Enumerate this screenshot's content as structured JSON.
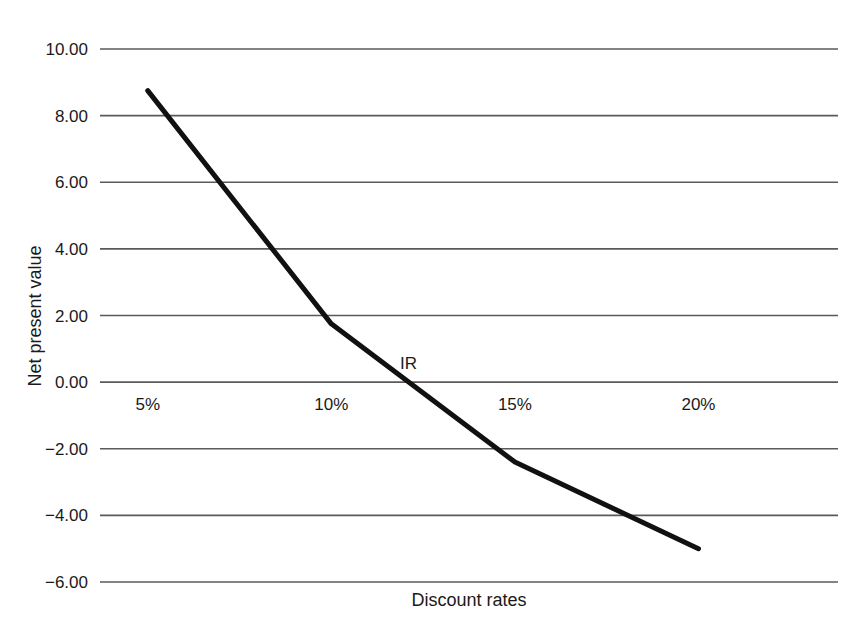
{
  "chart_data": {
    "type": "line",
    "title": "",
    "xlabel": "Discount rates",
    "ylabel": "Net present value",
    "x": [
      5,
      10,
      15,
      20
    ],
    "x_tick_labels": [
      "5%",
      "10%",
      "15%",
      "20%"
    ],
    "y_tick_labels": [
      "10.00",
      "8.00",
      "6.00",
      "4.00",
      "2.00",
      "0.00",
      "−2.00",
      "−4.00",
      "−6.00"
    ],
    "y_tick_values": [
      10,
      8,
      6,
      4,
      2,
      0,
      -2,
      -4,
      -6
    ],
    "series": [
      {
        "name": "Net present value",
        "values": [
          8.75,
          1.75,
          -2.4,
          -5.0
        ],
        "color": "#111111",
        "line_width": 5
      }
    ],
    "annotations": [
      {
        "text": "IR",
        "x": 12.1,
        "y": 0.55,
        "note": "IRR label at the zero crossing of the NPV curve"
      }
    ],
    "xlim": [
      3.7,
      23.8
    ],
    "ylim": [
      -6,
      10
    ],
    "grid": {
      "horizontal": true,
      "vertical": false,
      "color": "#5a5a5a"
    },
    "legend": {
      "visible": false,
      "position": "none"
    },
    "background_color": "#ffffff"
  },
  "figure": {
    "plot_left_px": 100,
    "plot_right_px": 838,
    "plot_top_px": 49,
    "plot_bottom_px": 582
  }
}
